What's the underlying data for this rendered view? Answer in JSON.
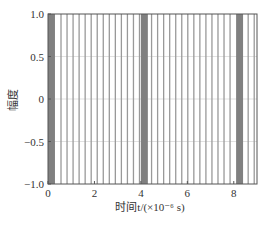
{
  "chart_data": {
    "type": "line",
    "title": "",
    "xlabel": "时间t/(×10⁻⁶ s)",
    "ylabel": "幅度",
    "xlim": [
      0,
      9
    ],
    "ylim": [
      -1.0,
      1.0
    ],
    "x_ticks": [
      "0",
      "2",
      "4",
      "6",
      "8"
    ],
    "y_ticks": [
      "1.0",
      "0.5",
      "0",
      "-0.5",
      "-1.0"
    ],
    "grid": true,
    "legend": null,
    "period_us": 4.1,
    "dense_bands_us": [
      [
        0.0,
        0.3
      ],
      [
        4.0,
        4.3
      ],
      [
        8.1,
        8.4
      ]
    ],
    "line_spacing_us": 0.26,
    "series": [
      {
        "name": "signal",
        "color": "#888888"
      }
    ]
  }
}
